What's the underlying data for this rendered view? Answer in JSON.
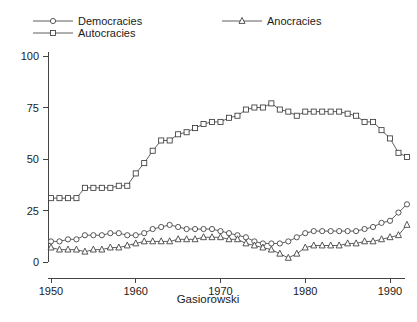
{
  "chart_data": {
    "type": "line",
    "title": "",
    "subtitle": "",
    "xlabel": "Gasiorowski",
    "ylabel": "",
    "xlim": [
      1949,
      1993
    ],
    "ylim": [
      0,
      100
    ],
    "grid": false,
    "legend_position": "top",
    "x_ticks": [
      1950,
      1960,
      1970,
      1980,
      1990
    ],
    "y_ticks": [
      0,
      25,
      50,
      75,
      100
    ],
    "x": [
      1950,
      1951,
      1952,
      1953,
      1954,
      1955,
      1956,
      1957,
      1958,
      1959,
      1960,
      1961,
      1962,
      1963,
      1964,
      1965,
      1966,
      1967,
      1968,
      1969,
      1970,
      1971,
      1972,
      1973,
      1974,
      1975,
      1976,
      1977,
      1978,
      1979,
      1980,
      1981,
      1982,
      1983,
      1984,
      1985,
      1986,
      1987,
      1988,
      1989,
      1990,
      1991,
      1992
    ],
    "series": [
      {
        "name": "Democracies",
        "marker": "circle",
        "values": [
          10,
          10,
          11,
          11,
          13,
          13,
          13,
          14,
          14,
          13,
          13,
          14,
          16,
          17,
          18,
          17,
          16,
          16,
          16,
          16,
          15,
          14,
          13,
          12,
          10,
          9,
          9,
          9,
          10,
          12,
          14,
          15,
          15,
          15,
          15,
          15,
          15,
          16,
          17,
          19,
          20,
          24,
          28
        ]
      },
      {
        "name": "Autocracies",
        "marker": "square",
        "values": [
          31,
          31,
          31,
          31,
          36,
          36,
          36,
          36,
          37,
          37,
          43,
          48,
          54,
          59,
          59,
          62,
          63,
          65,
          67,
          68,
          68,
          70,
          71,
          74,
          75,
          75,
          77,
          74,
          73,
          71,
          73,
          73,
          73,
          73,
          73,
          72,
          71,
          68,
          68,
          64,
          60,
          53,
          51
        ]
      },
      {
        "name": "Anocracies",
        "marker": "triangle",
        "values": [
          7,
          6,
          6,
          6,
          5,
          6,
          6,
          7,
          7,
          8,
          9,
          10,
          10,
          10,
          10,
          11,
          11,
          11,
          12,
          12,
          12,
          11,
          11,
          9,
          8,
          7,
          6,
          4,
          2,
          4,
          7,
          8,
          8,
          8,
          8,
          9,
          9,
          10,
          10,
          11,
          12,
          13,
          18
        ]
      }
    ]
  },
  "legend": {
    "items": [
      {
        "label": "Democracies",
        "marker": "circle"
      },
      {
        "label": "Autocracies",
        "marker": "square"
      },
      {
        "label": "Anocracies",
        "marker": "triangle"
      }
    ]
  },
  "colors": {
    "line": "#4d4d4d",
    "marker_stroke": "#3a3a3a",
    "marker_fill": "#ffffff",
    "axis": "#444444",
    "text": "#1a1a1a",
    "background": "#ffffff"
  }
}
